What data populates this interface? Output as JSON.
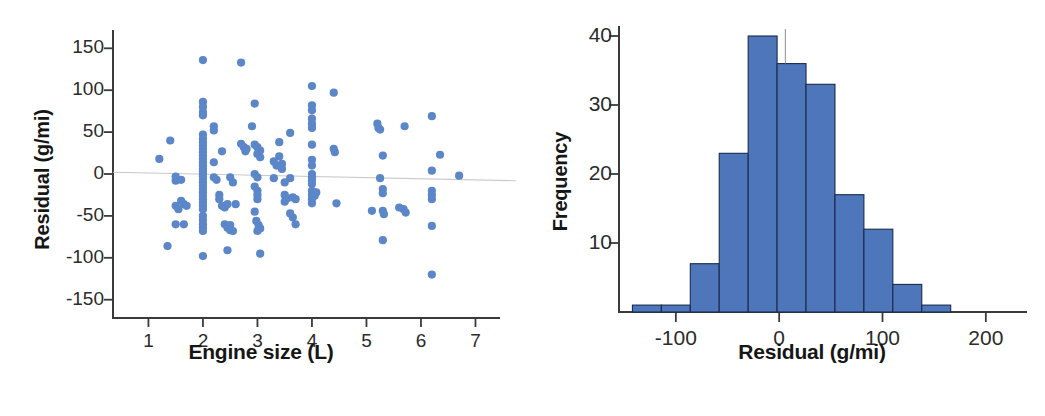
{
  "figure": {
    "panels": [
      "scatter",
      "histogram"
    ]
  },
  "colors": {
    "scatter_point": "#5b86c8",
    "bar_fill": "#4d76bb",
    "bar_stroke": "#1b2a4d",
    "axis": "#3a3a3a",
    "zero_line": "#c9c9c9",
    "text": "#161616"
  },
  "chart_data": [
    {
      "type": "scatter",
      "title": "",
      "xlabel": "Engine size (L)",
      "ylabel": "Residual (g/mi)",
      "xlim": [
        0.35,
        7.45
      ],
      "ylim": [
        -175,
        172
      ],
      "xticks": [
        1,
        2,
        3,
        4,
        5,
        6,
        7
      ],
      "xtick_labels": [
        "1",
        "2",
        "3",
        "4",
        "5",
        "6",
        "7"
      ],
      "yticks": [
        150,
        100,
        50,
        0,
        -50,
        -100,
        -150
      ],
      "ytick_labels": [
        "150",
        "100",
        "50",
        "0",
        "-50",
        "-100",
        "-150"
      ],
      "grid": false,
      "legend": null,
      "annotations": [
        {
          "kind": "zero-reference-line",
          "y0": 2,
          "y1": -8,
          "note": "near-horizontal line at residual = 0"
        }
      ],
      "points": [
        [
          1.2,
          18
        ],
        [
          1.4,
          40
        ],
        [
          1.5,
          -8
        ],
        [
          1.5,
          -3
        ],
        [
          1.6,
          -7
        ],
        [
          1.5,
          -38
        ],
        [
          1.55,
          -42
        ],
        [
          1.6,
          -32
        ],
        [
          1.65,
          -36
        ],
        [
          1.7,
          -38
        ],
        [
          1.5,
          -60
        ],
        [
          1.65,
          -60
        ],
        [
          1.35,
          -86
        ],
        [
          2.0,
          136
        ],
        [
          2.0,
          86
        ],
        [
          2.0,
          80
        ],
        [
          2.0,
          74
        ],
        [
          2.0,
          70
        ],
        [
          2.0,
          47
        ],
        [
          2.0,
          42
        ],
        [
          2.0,
          38
        ],
        [
          2.0,
          34
        ],
        [
          2.0,
          30
        ],
        [
          2.0,
          26
        ],
        [
          2.0,
          22
        ],
        [
          2.0,
          18
        ],
        [
          2.0,
          14
        ],
        [
          2.0,
          10
        ],
        [
          2.0,
          6
        ],
        [
          2.0,
          3
        ],
        [
          2.0,
          0
        ],
        [
          2.0,
          -3
        ],
        [
          2.0,
          -6
        ],
        [
          2.0,
          -10
        ],
        [
          2.0,
          -14
        ],
        [
          2.0,
          -18
        ],
        [
          2.0,
          -22
        ],
        [
          2.0,
          -26
        ],
        [
          2.0,
          -30
        ],
        [
          2.0,
          -34
        ],
        [
          2.0,
          -38
        ],
        [
          2.0,
          -42
        ],
        [
          2.0,
          -50
        ],
        [
          2.0,
          -55
        ],
        [
          2.0,
          -60
        ],
        [
          2.0,
          -64
        ],
        [
          2.0,
          -68
        ],
        [
          2.0,
          -98
        ],
        [
          2.2,
          57
        ],
        [
          2.2,
          52
        ],
        [
          2.2,
          14
        ],
        [
          2.2,
          -4
        ],
        [
          2.25,
          -7
        ],
        [
          2.3,
          -25
        ],
        [
          2.3,
          -30
        ],
        [
          2.35,
          -38
        ],
        [
          2.4,
          -40
        ],
        [
          2.45,
          -36
        ],
        [
          2.4,
          -60
        ],
        [
          2.45,
          -64
        ],
        [
          2.5,
          -67
        ],
        [
          2.5,
          -61
        ],
        [
          2.55,
          -68
        ],
        [
          2.45,
          -91
        ],
        [
          2.35,
          27
        ],
        [
          2.5,
          -4
        ],
        [
          2.55,
          -10
        ],
        [
          2.6,
          -36
        ],
        [
          2.7,
          133
        ],
        [
          2.7,
          36
        ],
        [
          2.75,
          32
        ],
        [
          2.8,
          30
        ],
        [
          2.78,
          27
        ],
        [
          2.95,
          84
        ],
        [
          2.9,
          57
        ],
        [
          2.95,
          35
        ],
        [
          3.0,
          32
        ],
        [
          3.05,
          28
        ],
        [
          3.0,
          24
        ],
        [
          3.05,
          20
        ],
        [
          2.95,
          0
        ],
        [
          3.0,
          -4
        ],
        [
          2.95,
          -15
        ],
        [
          3.0,
          -20
        ],
        [
          3.0,
          -25
        ],
        [
          3.0,
          -30
        ],
        [
          2.95,
          -45
        ],
        [
          2.98,
          -56
        ],
        [
          3.02,
          -61
        ],
        [
          3.05,
          -65
        ],
        [
          3.0,
          -68
        ],
        [
          3.05,
          -95
        ],
        [
          3.3,
          15
        ],
        [
          3.35,
          10
        ],
        [
          3.3,
          -5
        ],
        [
          3.4,
          38
        ],
        [
          3.4,
          21
        ],
        [
          3.45,
          12
        ],
        [
          3.45,
          6
        ],
        [
          3.5,
          -10
        ],
        [
          3.5,
          -25
        ],
        [
          3.55,
          -29
        ],
        [
          3.5,
          -33
        ],
        [
          3.6,
          49
        ],
        [
          3.6,
          -5
        ],
        [
          3.65,
          -28
        ],
        [
          3.7,
          -30
        ],
        [
          3.6,
          -47
        ],
        [
          3.65,
          -52
        ],
        [
          3.7,
          -60
        ],
        [
          4.0,
          105
        ],
        [
          4.0,
          82
        ],
        [
          4.0,
          76
        ],
        [
          4.0,
          66
        ],
        [
          4.0,
          60
        ],
        [
          4.0,
          55
        ],
        [
          4.0,
          35
        ],
        [
          4.0,
          17
        ],
        [
          4.0,
          10
        ],
        [
          4.0,
          0
        ],
        [
          4.0,
          -4
        ],
        [
          4.0,
          -8
        ],
        [
          4.0,
          -12
        ],
        [
          4.0,
          -20
        ],
        [
          4.0,
          -25
        ],
        [
          4.0,
          -30
        ],
        [
          4.0,
          -35
        ],
        [
          4.05,
          -26
        ],
        [
          4.08,
          -22
        ],
        [
          4.4,
          97
        ],
        [
          4.4,
          30
        ],
        [
          4.42,
          26
        ],
        [
          4.45,
          -35
        ],
        [
          5.2,
          60
        ],
        [
          5.22,
          55
        ],
        [
          5.25,
          53
        ],
        [
          5.3,
          22
        ],
        [
          5.25,
          -5
        ],
        [
          5.3,
          -18
        ],
        [
          5.3,
          -23
        ],
        [
          5.1,
          -44
        ],
        [
          5.3,
          -44
        ],
        [
          5.32,
          -48
        ],
        [
          5.3,
          -79
        ],
        [
          5.7,
          57
        ],
        [
          5.6,
          -40
        ],
        [
          5.68,
          -42
        ],
        [
          5.72,
          -46
        ],
        [
          6.2,
          69
        ],
        [
          6.35,
          23
        ],
        [
          6.2,
          4
        ],
        [
          6.2,
          -20
        ],
        [
          6.2,
          -25
        ],
        [
          6.2,
          -30
        ],
        [
          6.2,
          -62
        ],
        [
          6.2,
          -120
        ],
        [
          6.7,
          -2
        ]
      ]
    },
    {
      "type": "bar",
      "subtype": "histogram",
      "title": "",
      "xlabel": "Residual (g/mi)",
      "ylabel": "Frequency",
      "xlim": [
        -155,
        235
      ],
      "ylim": [
        0,
        42
      ],
      "xticks": [
        -100,
        0,
        100,
        200
      ],
      "xtick_labels": [
        "-100",
        "0",
        "100",
        "200"
      ],
      "yticks": [
        10,
        20,
        30,
        40
      ],
      "ytick_labels": [
        "10",
        "20",
        "30",
        "40"
      ],
      "grid": false,
      "legend": null,
      "bin_width": 28,
      "bin_left_edges": [
        -142,
        -114,
        -86,
        -58,
        -30,
        -2,
        26,
        54,
        82,
        110,
        138
      ],
      "bin_centers": [
        -128,
        -100,
        -72,
        -44,
        -16,
        12,
        40,
        68,
        96,
        124,
        152
      ],
      "values": [
        1,
        1,
        7,
        23,
        40,
        36,
        33,
        17,
        12,
        4,
        1
      ],
      "annotations": [
        {
          "kind": "vertical-marker",
          "x": 6,
          "y_top": 41,
          "note": "thin grey needle above the 36-count bar"
        }
      ]
    }
  ]
}
